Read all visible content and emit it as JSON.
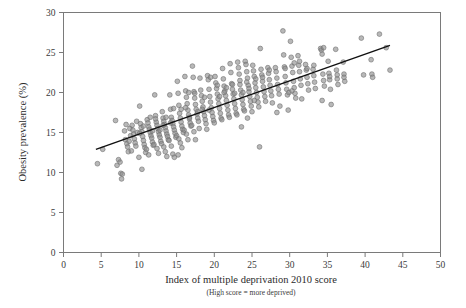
{
  "chart_data": {
    "type": "scatter",
    "title": "",
    "xlabel": "Index of multiple deprivation 2010 score",
    "xlabel_sub": "(High score = more deprived)",
    "ylabel": "Obesity prevalence (%)",
    "xlim": [
      0,
      50
    ],
    "ylim": [
      0,
      30
    ],
    "xticks": [
      0,
      5,
      10,
      15,
      20,
      25,
      30,
      35,
      40,
      45,
      50
    ],
    "yticks": [
      0,
      5,
      10,
      15,
      20,
      25,
      30
    ],
    "grid": false,
    "legend": "none",
    "marker_color": "#8c8c8c",
    "marker_edge_color": "#6e6e6e",
    "marker_radius_px": 2.4,
    "axis_color": "#7a7a7a",
    "trend_line": {
      "type": "linear-fit",
      "color": "#101010",
      "width_px": 1.4,
      "x_start": 4.3,
      "y_start": 12.9,
      "x_end": 43.3,
      "y_end": 25.9
    },
    "points": [
      [
        4.5,
        11.1
      ],
      [
        5.2,
        12.9
      ],
      [
        6.9,
        16.5
      ],
      [
        7.1,
        10.9
      ],
      [
        7.3,
        11.6
      ],
      [
        7.5,
        11.3
      ],
      [
        7.6,
        9.9
      ],
      [
        7.8,
        9.8
      ],
      [
        7.7,
        9.2
      ],
      [
        8.1,
        15.2
      ],
      [
        8.2,
        14.1
      ],
      [
        8.4,
        13.6
      ],
      [
        8.5,
        13.2
      ],
      [
        8.6,
        12.6
      ],
      [
        8.3,
        16.0
      ],
      [
        8.8,
        15.5
      ],
      [
        8.9,
        14.6
      ],
      [
        8.7,
        13.9
      ],
      [
        9.1,
        15.9
      ],
      [
        9.2,
        15.3
      ],
      [
        9.3,
        14.8
      ],
      [
        9.4,
        14.2
      ],
      [
        9.5,
        13.7
      ],
      [
        9.6,
        13.3
      ],
      [
        9.0,
        12.7
      ],
      [
        9.7,
        16.4
      ],
      [
        9.8,
        15.0
      ],
      [
        10.1,
        18.3
      ],
      [
        10.2,
        16.1
      ],
      [
        10.3,
        15.6
      ],
      [
        10.4,
        15.1
      ],
      [
        10.5,
        14.5
      ],
      [
        10.6,
        14.0
      ],
      [
        10.7,
        13.5
      ],
      [
        10.8,
        13.1
      ],
      [
        10.9,
        12.5
      ],
      [
        10.0,
        11.9
      ],
      [
        10.4,
        10.4
      ],
      [
        10.1,
        14.9
      ],
      [
        10.6,
        15.8
      ],
      [
        11.1,
        16.6
      ],
      [
        11.2,
        16.2
      ],
      [
        11.3,
        15.7
      ],
      [
        11.4,
        15.4
      ],
      [
        11.5,
        15.0
      ],
      [
        11.6,
        14.6
      ],
      [
        11.7,
        14.3
      ],
      [
        11.8,
        13.8
      ],
      [
        11.9,
        13.4
      ],
      [
        11.0,
        12.9
      ],
      [
        11.3,
        12.2
      ],
      [
        11.5,
        16.9
      ],
      [
        11.8,
        15.2
      ],
      [
        12.1,
        19.7
      ],
      [
        12.2,
        17.1
      ],
      [
        12.3,
        16.3
      ],
      [
        12.4,
        15.9
      ],
      [
        12.5,
        15.5
      ],
      [
        12.6,
        15.1
      ],
      [
        12.7,
        14.7
      ],
      [
        12.8,
        14.4
      ],
      [
        12.9,
        13.9
      ],
      [
        12.0,
        13.5
      ],
      [
        12.4,
        13.0
      ],
      [
        12.6,
        12.4
      ],
      [
        12.2,
        16.7
      ],
      [
        12.8,
        15.3
      ],
      [
        13.1,
        17.6
      ],
      [
        13.2,
        16.8
      ],
      [
        13.3,
        16.4
      ],
      [
        13.4,
        16.0
      ],
      [
        13.5,
        15.6
      ],
      [
        13.6,
        15.2
      ],
      [
        13.7,
        14.8
      ],
      [
        13.8,
        14.5
      ],
      [
        13.9,
        14.1
      ],
      [
        13.0,
        13.6
      ],
      [
        13.3,
        13.2
      ],
      [
        13.5,
        12.6
      ],
      [
        13.7,
        12.0
      ],
      [
        13.2,
        15.9
      ],
      [
        13.6,
        16.9
      ],
      [
        14.1,
        19.7
      ],
      [
        14.2,
        17.9
      ],
      [
        14.3,
        16.9
      ],
      [
        14.4,
        16.5
      ],
      [
        14.5,
        16.1
      ],
      [
        14.6,
        15.7
      ],
      [
        14.7,
        15.3
      ],
      [
        14.8,
        14.9
      ],
      [
        14.9,
        14.4
      ],
      [
        14.0,
        14.0
      ],
      [
        14.3,
        13.3
      ],
      [
        14.5,
        12.3
      ],
      [
        14.7,
        11.9
      ],
      [
        14.2,
        16.2
      ],
      [
        14.6,
        18.0
      ],
      [
        15.1,
        21.4
      ],
      [
        15.2,
        19.9
      ],
      [
        15.3,
        18.4
      ],
      [
        15.4,
        17.4
      ],
      [
        15.5,
        16.8
      ],
      [
        15.6,
        16.3
      ],
      [
        15.7,
        15.8
      ],
      [
        15.8,
        15.4
      ],
      [
        15.9,
        15.0
      ],
      [
        15.0,
        14.6
      ],
      [
        15.3,
        14.2
      ],
      [
        15.5,
        13.7
      ],
      [
        15.7,
        13.1
      ],
      [
        15.2,
        12.2
      ],
      [
        15.6,
        17.9
      ],
      [
        16.1,
        22.0
      ],
      [
        16.2,
        20.2
      ],
      [
        16.3,
        19.4
      ],
      [
        16.4,
        18.6
      ],
      [
        16.5,
        17.8
      ],
      [
        16.6,
        17.2
      ],
      [
        16.7,
        16.7
      ],
      [
        16.8,
        16.2
      ],
      [
        16.9,
        15.8
      ],
      [
        16.0,
        15.3
      ],
      [
        16.3,
        14.8
      ],
      [
        16.5,
        14.1
      ],
      [
        16.7,
        16.9
      ],
      [
        16.2,
        18.1
      ],
      [
        16.6,
        20.0
      ],
      [
        17.1,
        23.3
      ],
      [
        17.2,
        21.9
      ],
      [
        17.3,
        20.1
      ],
      [
        17.4,
        19.3
      ],
      [
        17.5,
        18.5
      ],
      [
        17.6,
        17.9
      ],
      [
        17.7,
        17.3
      ],
      [
        17.8,
        16.8
      ],
      [
        17.9,
        16.4
      ],
      [
        17.0,
        15.9
      ],
      [
        17.3,
        15.1
      ],
      [
        17.5,
        14.1
      ],
      [
        17.4,
        19.9
      ],
      [
        17.8,
        17.6
      ],
      [
        18.1,
        21.8
      ],
      [
        18.2,
        20.3
      ],
      [
        18.3,
        19.6
      ],
      [
        18.4,
        18.9
      ],
      [
        18.5,
        18.2
      ],
      [
        18.6,
        17.6
      ],
      [
        18.7,
        17.1
      ],
      [
        18.8,
        16.6
      ],
      [
        18.9,
        16.1
      ],
      [
        18.0,
        15.5
      ],
      [
        18.4,
        17.9
      ],
      [
        18.7,
        19.4
      ],
      [
        19.1,
        22.1
      ],
      [
        19.2,
        21.6
      ],
      [
        19.3,
        20.4
      ],
      [
        19.4,
        19.5
      ],
      [
        19.5,
        18.8
      ],
      [
        19.6,
        18.1
      ],
      [
        19.7,
        17.5
      ],
      [
        19.8,
        17.0
      ],
      [
        19.9,
        16.5
      ],
      [
        19.0,
        15.4
      ],
      [
        19.5,
        21.9
      ],
      [
        19.3,
        17.8
      ],
      [
        20.1,
        22.0
      ],
      [
        20.2,
        21.2
      ],
      [
        20.3,
        20.5
      ],
      [
        20.4,
        19.8
      ],
      [
        20.5,
        19.2
      ],
      [
        20.6,
        18.6
      ],
      [
        20.7,
        18.0
      ],
      [
        20.8,
        17.4
      ],
      [
        20.9,
        16.8
      ],
      [
        20.0,
        16.2
      ],
      [
        20.4,
        20.9
      ],
      [
        20.7,
        19.5
      ],
      [
        21.1,
        23.0
      ],
      [
        21.2,
        21.7
      ],
      [
        21.3,
        20.8
      ],
      [
        21.4,
        20.2
      ],
      [
        21.5,
        19.6
      ],
      [
        21.6,
        19.0
      ],
      [
        21.7,
        18.4
      ],
      [
        21.8,
        17.8
      ],
      [
        21.9,
        17.2
      ],
      [
        21.0,
        16.6
      ],
      [
        21.3,
        20.0
      ],
      [
        21.6,
        20.6
      ],
      [
        22.1,
        23.6
      ],
      [
        22.2,
        22.5
      ],
      [
        22.3,
        21.1
      ],
      [
        22.4,
        20.4
      ],
      [
        22.5,
        19.8
      ],
      [
        22.6,
        19.2
      ],
      [
        22.7,
        18.6
      ],
      [
        22.8,
        18.0
      ],
      [
        22.9,
        17.4
      ],
      [
        22.0,
        16.9
      ],
      [
        22.4,
        21.0
      ],
      [
        22.7,
        19.9
      ],
      [
        23.1,
        23.8
      ],
      [
        23.2,
        23.1
      ],
      [
        23.3,
        22.3
      ],
      [
        23.4,
        21.0
      ],
      [
        23.5,
        20.3
      ],
      [
        23.6,
        19.7
      ],
      [
        23.7,
        19.1
      ],
      [
        23.8,
        18.5
      ],
      [
        23.9,
        17.9
      ],
      [
        23.0,
        17.2
      ],
      [
        23.4,
        21.5
      ],
      [
        23.6,
        15.7
      ],
      [
        23.8,
        20.0
      ],
      [
        24.1,
        23.9
      ],
      [
        24.2,
        23.5
      ],
      [
        24.3,
        22.6
      ],
      [
        24.4,
        21.8
      ],
      [
        24.5,
        20.9
      ],
      [
        24.6,
        20.1
      ],
      [
        24.7,
        19.5
      ],
      [
        24.8,
        18.9
      ],
      [
        24.9,
        18.3
      ],
      [
        24.0,
        17.7
      ],
      [
        24.3,
        21.3
      ],
      [
        24.6,
        20.5
      ],
      [
        24.4,
        16.8
      ],
      [
        25.1,
        23.4
      ],
      [
        25.2,
        22.7
      ],
      [
        25.3,
        22.0
      ],
      [
        25.4,
        21.2
      ],
      [
        25.5,
        20.6
      ],
      [
        25.6,
        20.0
      ],
      [
        25.7,
        19.4
      ],
      [
        25.8,
        18.8
      ],
      [
        25.9,
        18.2
      ],
      [
        25.0,
        17.6
      ],
      [
        25.5,
        21.7
      ],
      [
        25.3,
        19.0
      ],
      [
        26.1,
        25.5
      ],
      [
        26.2,
        22.9
      ],
      [
        26.3,
        22.2
      ],
      [
        26.4,
        21.4
      ],
      [
        26.5,
        20.7
      ],
      [
        26.6,
        20.1
      ],
      [
        26.7,
        19.5
      ],
      [
        26.8,
        18.9
      ],
      [
        26.0,
        13.2
      ],
      [
        26.4,
        21.9
      ],
      [
        27.1,
        23.1
      ],
      [
        27.2,
        22.4
      ],
      [
        27.3,
        21.6
      ],
      [
        27.4,
        20.9
      ],
      [
        27.5,
        20.2
      ],
      [
        27.6,
        19.6
      ],
      [
        27.7,
        18.7
      ],
      [
        27.3,
        22.8
      ],
      [
        28.1,
        23.1
      ],
      [
        28.2,
        22.6
      ],
      [
        28.3,
        21.8
      ],
      [
        28.4,
        21.0
      ],
      [
        28.5,
        20.4
      ],
      [
        28.6,
        19.8
      ],
      [
        28.7,
        18.3
      ],
      [
        28.3,
        17.5
      ],
      [
        29.1,
        27.7
      ],
      [
        29.2,
        24.7
      ],
      [
        29.3,
        23.2
      ],
      [
        29.4,
        22.0
      ],
      [
        29.5,
        21.2
      ],
      [
        29.6,
        20.4
      ],
      [
        29.7,
        19.7
      ],
      [
        29.8,
        17.8
      ],
      [
        29.4,
        23.0
      ],
      [
        29.9,
        20.0
      ],
      [
        30.1,
        26.4
      ],
      [
        30.2,
        24.4
      ],
      [
        30.3,
        23.3
      ],
      [
        30.4,
        22.5
      ],
      [
        30.5,
        21.4
      ],
      [
        30.6,
        20.6
      ],
      [
        30.7,
        19.9
      ],
      [
        30.8,
        19.3
      ],
      [
        30.3,
        20.2
      ],
      [
        30.6,
        23.7
      ],
      [
        31.1,
        24.6
      ],
      [
        31.2,
        23.4
      ],
      [
        31.3,
        22.6
      ],
      [
        31.4,
        21.7
      ],
      [
        31.5,
        20.9
      ],
      [
        31.6,
        19.2
      ],
      [
        31.3,
        23.9
      ],
      [
        32.1,
        23.5
      ],
      [
        32.2,
        22.8
      ],
      [
        32.3,
        21.9
      ],
      [
        32.4,
        21.1
      ],
      [
        32.5,
        20.3
      ],
      [
        32.3,
        23.0
      ],
      [
        33.1,
        22.9
      ],
      [
        33.2,
        22.1
      ],
      [
        33.3,
        21.3
      ],
      [
        33.4,
        20.5
      ],
      [
        33.2,
        23.4
      ],
      [
        34.1,
        25.5
      ],
      [
        34.2,
        25.3
      ],
      [
        34.3,
        24.8
      ],
      [
        34.4,
        22.3
      ],
      [
        34.5,
        21.5
      ],
      [
        34.6,
        20.8
      ],
      [
        34.3,
        19.0
      ],
      [
        34.5,
        25.6
      ],
      [
        35.1,
        23.9
      ],
      [
        35.2,
        22.4
      ],
      [
        35.3,
        21.6
      ],
      [
        35.4,
        20.4
      ],
      [
        35.5,
        18.5
      ],
      [
        35.3,
        22.0
      ],
      [
        36.1,
        25.4
      ],
      [
        36.2,
        22.8
      ],
      [
        36.3,
        21.7
      ],
      [
        36.4,
        21.0
      ],
      [
        36.3,
        22.2
      ],
      [
        37.1,
        23.8
      ],
      [
        37.2,
        22.3
      ],
      [
        37.3,
        21.4
      ],
      [
        37.2,
        21.9
      ],
      [
        39.5,
        26.8
      ],
      [
        39.8,
        22.2
      ],
      [
        40.8,
        24.1
      ],
      [
        40.9,
        22.3
      ],
      [
        41.0,
        21.9
      ],
      [
        41.9,
        27.3
      ],
      [
        42.8,
        25.6
      ],
      [
        43.3,
        22.8
      ]
    ]
  }
}
